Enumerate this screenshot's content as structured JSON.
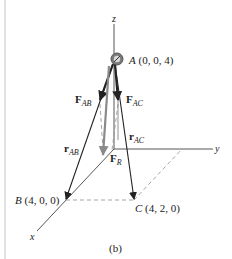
{
  "figure": {
    "caption": "(b)",
    "axes": {
      "x": "x",
      "y": "y",
      "z": "z"
    },
    "points": {
      "A": {
        "name": "A",
        "coords": "(0, 0, 4)"
      },
      "B": {
        "name": "B",
        "coords": "(4, 0, 0)"
      },
      "C": {
        "name": "C",
        "coords": "(4, 2, 0)"
      }
    },
    "vectors": {
      "F_AB": {
        "main": "F",
        "sub": "AB"
      },
      "F_AC": {
        "main": "F",
        "sub": "AC"
      },
      "F_R": {
        "main": "F",
        "sub": "R"
      },
      "r_AB": {
        "main": "r",
        "sub": "AB"
      },
      "r_AC": {
        "main": "r",
        "sub": "AC"
      }
    },
    "colors": {
      "line": "#222222",
      "resultant": "#8a8a8a",
      "dashed": "#9a9a9a",
      "ring": "#6e6e6e",
      "border": "#e2e2e2"
    }
  }
}
